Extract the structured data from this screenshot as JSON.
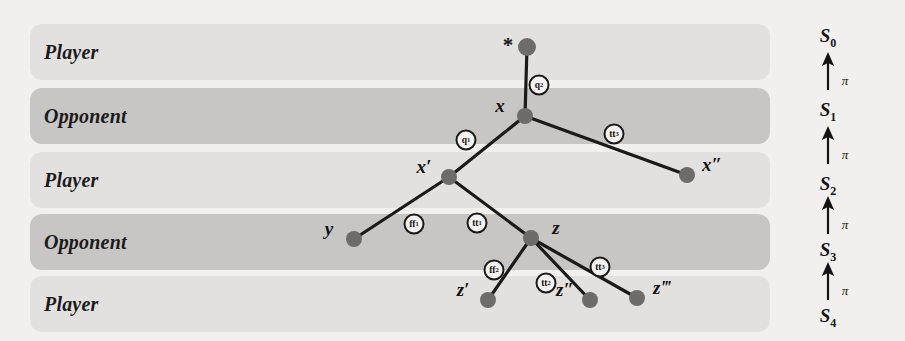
{
  "diagram": {
    "colors": {
      "page_background": "#f2f0ee",
      "band_light": "#e3e1df",
      "band_dark": "#c8c6c4",
      "node_fill": "#6e6c6a",
      "edge_stroke": "#1a1a1a",
      "text": "#121212"
    }
  },
  "bands": [
    {
      "label": "Player",
      "shade": "light",
      "y": 24
    },
    {
      "label": "Opponent",
      "shade": "dark",
      "y": 88
    },
    {
      "label": "Player",
      "shade": "light",
      "y": 152
    },
    {
      "label": "Opponent",
      "shade": "dark",
      "y": 214
    },
    {
      "label": "Player",
      "shade": "light",
      "y": 276
    }
  ],
  "nodes": [
    {
      "id": "root",
      "label": "",
      "label_pos": "none",
      "x": 527,
      "y": 47,
      "r": 9
    },
    {
      "id": "x",
      "label": "x",
      "label_pos": "left",
      "x": 525,
      "y": 116,
      "r": 8
    },
    {
      "id": "xp",
      "label": "x′",
      "label_pos": "left",
      "x": 449,
      "y": 177,
      "r": 8
    },
    {
      "id": "xpp",
      "label": "x″",
      "label_pos": "right",
      "x": 687,
      "y": 175,
      "r": 8
    },
    {
      "id": "y",
      "label": "y",
      "label_pos": "left",
      "x": 354,
      "y": 239,
      "r": 8
    },
    {
      "id": "z",
      "label": "z",
      "label_pos": "right",
      "x": 531,
      "y": 238,
      "r": 8
    },
    {
      "id": "zp",
      "label": "z′",
      "label_pos": "left",
      "x": 488,
      "y": 300,
      "r": 8
    },
    {
      "id": "zpp",
      "label": "z″",
      "label_pos": "left",
      "x": 590,
      "y": 300,
      "r": 8
    },
    {
      "id": "zppp",
      "label": "z‴",
      "label_pos": "right",
      "x": 637,
      "y": 298,
      "r": 8
    }
  ],
  "star_marker": {
    "symbol": "*",
    "x": 508,
    "y": 45
  },
  "edges": [
    {
      "from": "root",
      "to": "x",
      "label_base": "q",
      "label_sub": "2",
      "label_x": 539,
      "label_y": 85
    },
    {
      "from": "x",
      "to": "xp",
      "label_base": "q",
      "label_sub": "1",
      "label_x": 466,
      "label_y": 140
    },
    {
      "from": "x",
      "to": "xpp",
      "label_base": "tt",
      "label_sub": "3",
      "label_x": 614,
      "label_y": 134
    },
    {
      "from": "xp",
      "to": "y",
      "label_base": "ff",
      "label_sub": "1",
      "label_x": 414,
      "label_y": 224
    },
    {
      "from": "xp",
      "to": "z",
      "label_base": "tt",
      "label_sub": "1",
      "label_x": 477,
      "label_y": 223
    },
    {
      "from": "z",
      "to": "zp",
      "label_base": "ff",
      "label_sub": "2",
      "label_x": 494,
      "label_y": 270
    },
    {
      "from": "z",
      "to": "zpp",
      "label_base": "tt",
      "label_sub": "2",
      "label_x": 546,
      "label_y": 283
    },
    {
      "from": "z",
      "to": "zppp",
      "label_base": "tt",
      "label_sub": "3",
      "label_x": 600,
      "label_y": 267
    }
  ],
  "state_ladder": {
    "arrow_label": "π",
    "states": [
      {
        "base": "S",
        "sub": "0",
        "y": 38
      },
      {
        "base": "S",
        "sub": "1",
        "y": 112
      },
      {
        "base": "S",
        "sub": "2",
        "y": 186
      },
      {
        "base": "S",
        "sub": "3",
        "y": 252
      },
      {
        "base": "S",
        "sub": "4",
        "y": 318
      }
    ],
    "arrows": [
      {
        "y": 75,
        "label": "π"
      },
      {
        "y": 149,
        "label": "π"
      },
      {
        "y": 219,
        "label": "π"
      },
      {
        "y": 285,
        "label": "π"
      }
    ]
  }
}
